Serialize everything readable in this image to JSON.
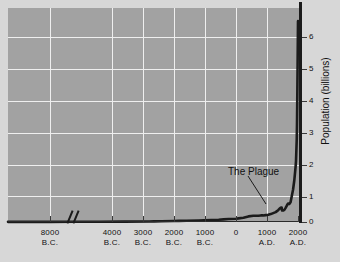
{
  "chart_data": {
    "type": "line",
    "title": "",
    "xlabel": "",
    "ylabel": "Population (billions)",
    "ylim": [
      0,
      6.5
    ],
    "xlim": [
      -10000,
      2000
    ],
    "grid": true,
    "legend": false,
    "axis_break": {
      "label": "axis-break",
      "after": "8000 B.C."
    },
    "xticks": [
      {
        "value": -8000,
        "line1": "8000",
        "line2": "B.C."
      },
      {
        "value": -4000,
        "line1": "4000",
        "line2": "B.C."
      },
      {
        "value": -3000,
        "line1": "3000",
        "line2": "B.C."
      },
      {
        "value": -2000,
        "line1": "2000",
        "line2": "B.C."
      },
      {
        "value": -1000,
        "line1": "1000",
        "line2": "B.C."
      },
      {
        "value": 0,
        "line1": "0",
        "line2": ""
      },
      {
        "value": 1000,
        "line1": "1000",
        "line2": "A.D."
      },
      {
        "value": 2000,
        "line1": "2000",
        "line2": "A.D."
      }
    ],
    "yticks": [
      {
        "value": 0,
        "label": "0"
      },
      {
        "value": 1,
        "label": "1"
      },
      {
        "value": 2,
        "label": "2"
      },
      {
        "value": 3,
        "label": "3"
      },
      {
        "value": 4,
        "label": "4"
      },
      {
        "value": 5,
        "label": "5"
      },
      {
        "value": 6,
        "label": "6"
      }
    ],
    "annotations": [
      {
        "text": "The Plague",
        "x": 1350,
        "y": 0.37
      }
    ],
    "series": [
      {
        "name": "World population",
        "color": "#1b1b1b",
        "x": [
          -10000,
          -9000,
          -8000,
          -7000,
          -6000,
          -5000,
          -4000,
          -3800,
          -3500,
          -3000,
          -2800,
          -2500,
          -2000,
          -1800,
          -1500,
          -1200,
          -1000,
          -800,
          -500,
          -400,
          -200,
          0,
          200,
          400,
          500,
          600,
          700,
          800,
          900,
          1000,
          1100,
          1200,
          1250,
          1300,
          1340,
          1350,
          1360,
          1400,
          1450,
          1500,
          1550,
          1600,
          1650,
          1700,
          1750,
          1800,
          1850,
          1900,
          1920,
          1940,
          1950,
          1960,
          1970,
          1980,
          1990,
          2000
        ],
        "y": [
          0.004,
          0.005,
          0.005,
          0.006,
          0.007,
          0.01,
          0.015,
          0.02,
          0.025,
          0.03,
          0.035,
          0.04,
          0.045,
          0.05,
          0.06,
          0.07,
          0.08,
          0.09,
          0.1,
          0.11,
          0.13,
          0.17,
          0.19,
          0.19,
          0.2,
          0.2,
          0.21,
          0.22,
          0.24,
          0.27,
          0.3,
          0.36,
          0.4,
          0.43,
          0.44,
          0.37,
          0.35,
          0.35,
          0.37,
          0.43,
          0.5,
          0.56,
          0.55,
          0.6,
          0.79,
          0.98,
          1.26,
          1.65,
          1.86,
          2.3,
          2.52,
          3.02,
          3.7,
          4.44,
          5.27,
          6.1
        ]
      }
    ]
  },
  "figure": {
    "background_color": "#d7d7d7",
    "plot_background_color": "#a2a2a2",
    "grid_color": "#efefef",
    "axis_color": "#1b1b1b"
  }
}
